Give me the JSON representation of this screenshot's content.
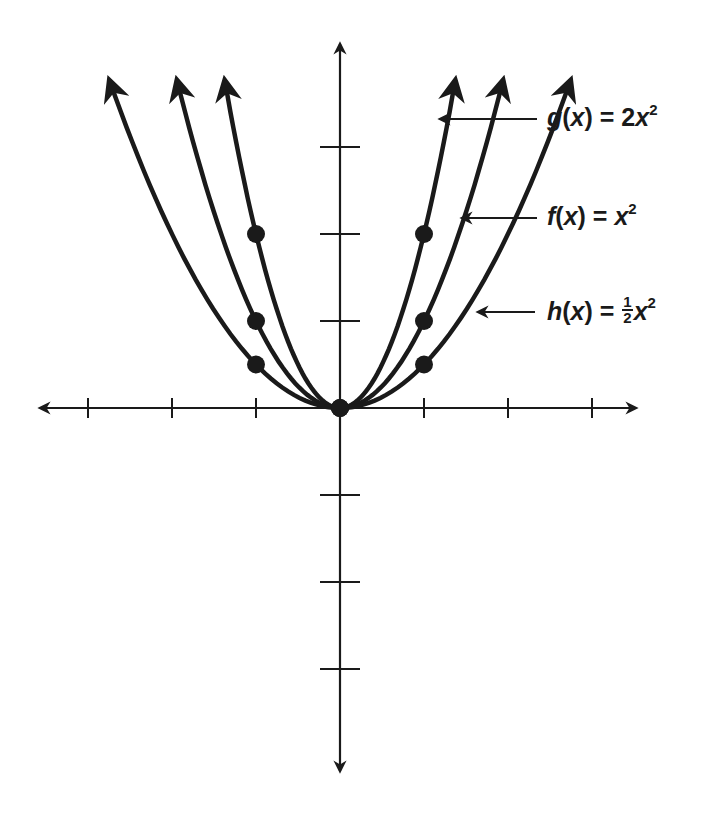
{
  "chart_data": {
    "type": "line",
    "title": "",
    "xlabel": "",
    "ylabel": "",
    "grid": false,
    "x_ticks": [
      -3,
      -2,
      -1,
      1,
      2,
      3
    ],
    "y_ticks": [
      -3,
      -2,
      -1,
      1,
      2,
      3
    ],
    "xlim": [
      -3.6,
      3.5
    ],
    "ylim": [
      -4.2,
      4.2
    ],
    "series": [
      {
        "name": "g(x) = 2x²",
        "function": "2x^2",
        "points": [
          {
            "x": -1,
            "y": 2
          },
          {
            "x": 0,
            "y": 0
          },
          {
            "x": 1,
            "y": 2
          }
        ]
      },
      {
        "name": "f(x) = x²",
        "function": "x^2",
        "points": [
          {
            "x": -1,
            "y": 1
          },
          {
            "x": 0,
            "y": 0
          },
          {
            "x": 1,
            "y": 1
          }
        ]
      },
      {
        "name": "h(x) = ½x²",
        "function": "0.5x^2",
        "points": [
          {
            "x": -1,
            "y": 0.5
          },
          {
            "x": 0,
            "y": 0
          },
          {
            "x": 1,
            "y": 0.5
          }
        ]
      }
    ],
    "annotations": [
      {
        "text": "g(x) = 2x²",
        "points_to": "g"
      },
      {
        "text": "f(x) = x²",
        "points_to": "f"
      },
      {
        "text": "h(x) = ½x²",
        "points_to": "h"
      }
    ]
  },
  "labels": {
    "g": {
      "fname": "g",
      "arg": "x",
      "lhs_open": "(",
      "lhs_close": ")",
      "eq": " = ",
      "coef": "2",
      "var": "x",
      "exp": "2"
    },
    "f": {
      "fname": "f",
      "arg": "x",
      "lhs_open": "(",
      "lhs_close": ")",
      "eq": " = ",
      "var": "x",
      "exp": "2"
    },
    "h": {
      "fname": "h",
      "arg": "x",
      "lhs_open": "(",
      "lhs_close": ")",
      "eq": " = ",
      "num": "1",
      "den": "2",
      "var": "x",
      "exp": "2"
    }
  },
  "style": {
    "ink": "#1a1a1a",
    "background": "#ffffff"
  }
}
